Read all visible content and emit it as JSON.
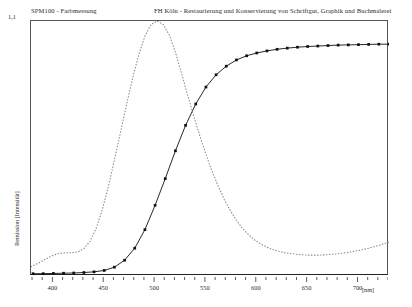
{
  "header": {
    "left": "SPM100 - Farbmessung",
    "right": "FH Köln - Restaurierung und Konservierung von Schriftgut, Graphik und Buchmalerei"
  },
  "axes": {
    "y_max_label": "1,1",
    "y_title": "Remission [Intensität]",
    "x_unit": "[nm]"
  },
  "chart_data": {
    "type": "line",
    "title": "SPM100 - Farbmessung",
    "xlabel": "[nm]",
    "ylabel": "Remission [Intensität]",
    "xlim": [
      378,
      730
    ],
    "ylim": [
      0,
      1.1
    ],
    "grid": false,
    "legend": "none",
    "xticks": [
      400,
      450,
      500,
      550,
      600,
      650,
      700
    ],
    "xtick_labels": [
      "400",
      "450",
      "500",
      "550",
      "600",
      "650",
      "700"
    ],
    "yticks": [
      1.1
    ],
    "ytick_labels": [
      "1,1"
    ],
    "series": [
      {
        "name": "Remission (Messkurve)",
        "style": "solid-with-square-markers",
        "color": "#111111",
        "markers": true,
        "x": [
          380,
          390,
          400,
          410,
          420,
          430,
          440,
          450,
          460,
          470,
          480,
          490,
          500,
          510,
          520,
          530,
          540,
          550,
          560,
          570,
          580,
          590,
          600,
          610,
          620,
          630,
          640,
          650,
          660,
          670,
          680,
          690,
          700,
          710,
          720,
          730
        ],
        "y": [
          0.01,
          0.01,
          0.011,
          0.012,
          0.013,
          0.015,
          0.018,
          0.024,
          0.038,
          0.068,
          0.12,
          0.2,
          0.305,
          0.42,
          0.54,
          0.65,
          0.742,
          0.815,
          0.868,
          0.905,
          0.932,
          0.95,
          0.962,
          0.971,
          0.978,
          0.983,
          0.987,
          0.99,
          0.992,
          0.994,
          0.996,
          0.997,
          0.998,
          0.999,
          1.0,
          1.0
        ]
      },
      {
        "name": "Normspektralwert (Referenz)",
        "style": "dotted",
        "color": "#8a8a8a",
        "markers": false,
        "x": [
          378,
          385,
          392,
          400,
          406,
          412,
          418,
          424,
          430,
          436,
          442,
          448,
          454,
          460,
          466,
          472,
          478,
          484,
          490,
          496,
          502,
          508,
          514,
          520,
          526,
          532,
          538,
          544,
          550,
          556,
          562,
          568,
          574,
          580,
          586,
          592,
          598,
          604,
          610,
          616,
          622,
          628,
          634,
          640,
          650,
          660,
          670,
          680,
          690,
          700,
          710,
          720,
          730
        ],
        "y": [
          0.04,
          0.055,
          0.072,
          0.09,
          0.098,
          0.1,
          0.1,
          0.104,
          0.118,
          0.15,
          0.205,
          0.285,
          0.385,
          0.5,
          0.62,
          0.74,
          0.855,
          0.955,
          1.035,
          1.085,
          1.1,
          1.085,
          1.04,
          0.965,
          0.875,
          0.78,
          0.69,
          0.605,
          0.525,
          0.452,
          0.388,
          0.33,
          0.282,
          0.24,
          0.205,
          0.178,
          0.155,
          0.138,
          0.124,
          0.114,
          0.106,
          0.1,
          0.096,
          0.093,
          0.09,
          0.09,
          0.092,
          0.096,
          0.102,
          0.11,
          0.12,
          0.132,
          0.146
        ]
      }
    ]
  }
}
